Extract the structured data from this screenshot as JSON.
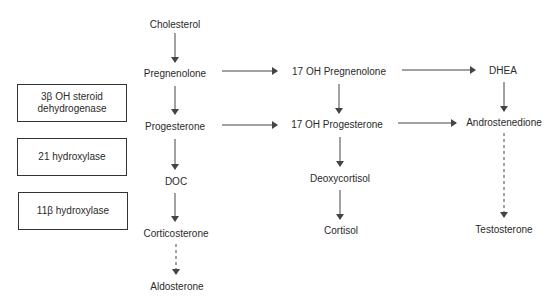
{
  "diagram": {
    "type": "steroid-biosynthesis-pathway",
    "colors": {
      "line": "#444444",
      "text": "#2a2a2a",
      "box_border": "#333333",
      "background": "#ffffff"
    },
    "enzymes": [
      {
        "id": "3b-hsd",
        "label_line1": "3β OH steroid",
        "label_line2": "dehydrogenase"
      },
      {
        "id": "21-hydroxylase",
        "label": "21 hydroxylase"
      },
      {
        "id": "11b-hydroxylase",
        "label": "11β hydroxylase"
      }
    ],
    "nodes": {
      "cholesterol": "Cholesterol",
      "pregnenolone": "Pregnenolone",
      "progesterone": "Progesterone",
      "doc": "DOC",
      "corticosterone": "Corticosterone",
      "aldosterone": "Aldosterone",
      "oh17_pregnenolone": "17 OH Pregnenolone",
      "oh17_progesterone": "17 OH Progesterone",
      "deoxycortisol": "Deoxycortisol",
      "cortisol": "Cortisol",
      "dhea": "DHEA",
      "androstenedione": "Androstenedione",
      "testosterone": "Testosterone"
    },
    "edges": [
      {
        "from": "Cholesterol",
        "to": "Pregnenolone",
        "style": "solid"
      },
      {
        "from": "Pregnenolone",
        "to": "Progesterone",
        "style": "solid"
      },
      {
        "from": "Progesterone",
        "to": "DOC",
        "style": "solid"
      },
      {
        "from": "DOC",
        "to": "Corticosterone",
        "style": "solid"
      },
      {
        "from": "Corticosterone",
        "to": "Aldosterone",
        "style": "dashed"
      },
      {
        "from": "Pregnenolone",
        "to": "17 OH Pregnenolone",
        "style": "solid"
      },
      {
        "from": "Progesterone",
        "to": "17 OH Progesterone",
        "style": "solid"
      },
      {
        "from": "17 OH Pregnenolone",
        "to": "17 OH Progesterone",
        "style": "solid"
      },
      {
        "from": "17 OH Progesterone",
        "to": "Deoxycortisol",
        "style": "solid"
      },
      {
        "from": "Deoxycortisol",
        "to": "Cortisol",
        "style": "solid"
      },
      {
        "from": "17 OH Pregnenolone",
        "to": "DHEA",
        "style": "solid"
      },
      {
        "from": "17 OH Progesterone",
        "to": "Androstenedione",
        "style": "solid"
      },
      {
        "from": "DHEA",
        "to": "Androstenedione",
        "style": "solid"
      },
      {
        "from": "Androstenedione",
        "to": "Testosterone",
        "style": "dashed"
      }
    ]
  }
}
